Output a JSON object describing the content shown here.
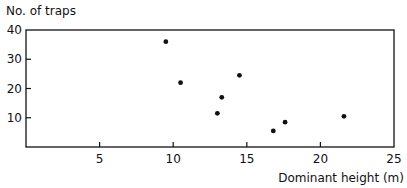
{
  "chart_data": {
    "type": "scatter",
    "title": "",
    "xlabel": "Dominant height (m)",
    "ylabel": "No. of traps",
    "xlim": [
      0,
      25
    ],
    "ylim": [
      0,
      40
    ],
    "x_ticks": [
      5,
      10,
      15,
      20,
      25
    ],
    "y_ticks": [
      10,
      20,
      30,
      40
    ],
    "grid": false,
    "legend": null,
    "series": [
      {
        "name": "traps",
        "points": [
          {
            "x": 9.5,
            "y": 36
          },
          {
            "x": 10.5,
            "y": 22
          },
          {
            "x": 13.0,
            "y": 11.5
          },
          {
            "x": 13.3,
            "y": 17
          },
          {
            "x": 14.5,
            "y": 24.5
          },
          {
            "x": 16.8,
            "y": 5.5
          },
          {
            "x": 17.6,
            "y": 8.5
          },
          {
            "x": 21.6,
            "y": 10.5
          }
        ]
      }
    ]
  }
}
